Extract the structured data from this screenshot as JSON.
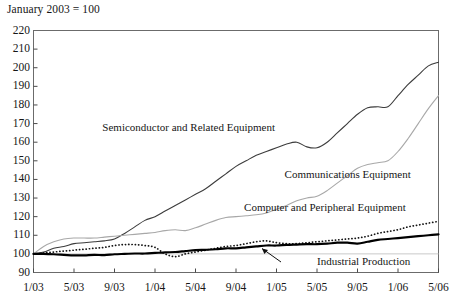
{
  "note": "January 2003 = 100",
  "chart_data": {
    "type": "line",
    "title": "",
    "subtitle": "January 2003 = 100",
    "xlabel": "",
    "ylabel": "",
    "grid": false,
    "legend_position": "inline-annotations",
    "xlim": [
      "1/03",
      "5/06"
    ],
    "ylim": [
      90,
      220
    ],
    "yticks": [
      90,
      100,
      110,
      120,
      130,
      140,
      150,
      160,
      170,
      180,
      190,
      200,
      210,
      220
    ],
    "xticks": [
      "1/03",
      "5/03",
      "9/03",
      "1/04",
      "5/04",
      "9/04",
      "1/05",
      "5/05",
      "9/05",
      "1/06",
      "5/06"
    ],
    "x": [
      "1/03",
      "2/03",
      "3/03",
      "4/03",
      "5/03",
      "6/03",
      "7/03",
      "8/03",
      "9/03",
      "10/03",
      "11/03",
      "12/03",
      "1/04",
      "2/04",
      "3/04",
      "4/04",
      "5/04",
      "6/04",
      "7/04",
      "8/04",
      "9/04",
      "10/04",
      "11/04",
      "12/04",
      "1/05",
      "2/05",
      "3/05",
      "4/05",
      "5/05",
      "6/05",
      "7/05",
      "8/05",
      "9/05",
      "10/05",
      "11/05",
      "12/05",
      "1/06",
      "2/06",
      "3/06",
      "4/06",
      "5/06"
    ],
    "series": [
      {
        "name": "Semiconductor and Related Equipment",
        "style": "solid-thin-dark",
        "color": "#3c3c3c",
        "label_x_pct": 17,
        "label_y_value": 168,
        "values": [
          100,
          101,
          103,
          104,
          105.5,
          106,
          106.5,
          107,
          108,
          111,
          114.5,
          118,
          120,
          123,
          126,
          129,
          132,
          135,
          139,
          143,
          147,
          150,
          153,
          155,
          157,
          159,
          160,
          157.5,
          157,
          160,
          165,
          170,
          175,
          178.5,
          179,
          179,
          185,
          191,
          196,
          201,
          203
        ]
      },
      {
        "name": "Communications Equipment",
        "style": "solid-thin-light",
        "color": "#a8a8a8",
        "label_x_pct": 62,
        "label_y_value": 143,
        "values": [
          100,
          104,
          106.5,
          108,
          108.5,
          108.5,
          108.5,
          109,
          109.5,
          110,
          110.5,
          111,
          111.5,
          112.5,
          113,
          112.5,
          114,
          116,
          118,
          119.5,
          120,
          120.5,
          121,
          122,
          124,
          126,
          128.5,
          130,
          131,
          134,
          138,
          142,
          146,
          148,
          149,
          150,
          155,
          162,
          170,
          178,
          185
        ]
      },
      {
        "name": "Computer and Peripheral Equipment",
        "style": "dotted",
        "color": "#141414",
        "label_x_pct": 52,
        "label_y_value": 125,
        "values": [
          100,
          100.5,
          101,
          101.5,
          102,
          102.5,
          103,
          103.5,
          104.5,
          105,
          105,
          104.5,
          103.5,
          100,
          98.5,
          100,
          101,
          102,
          103,
          104,
          104.5,
          105.5,
          106.5,
          107,
          106,
          105.5,
          105.5,
          106,
          106.5,
          107,
          107.5,
          108,
          108.5,
          109.5,
          111,
          112,
          113,
          114.5,
          115.5,
          116.5,
          117.5
        ]
      },
      {
        "name": "Industrial Production",
        "style": "solid-thick",
        "color": "#000000",
        "label_x_pct": 70,
        "label_y_value": 96,
        "values": [
          100,
          100,
          99.8,
          99.5,
          99.2,
          99.2,
          99.5,
          99.3,
          99.8,
          100,
          100.2,
          100.2,
          100.5,
          100.8,
          101,
          101.5,
          102,
          102.2,
          102.5,
          103,
          103,
          103.5,
          104,
          104.5,
          104.5,
          104.8,
          105,
          105.2,
          105.2,
          105.5,
          106,
          106,
          105.5,
          106.5,
          107.5,
          108,
          108.5,
          109,
          109.5,
          110,
          110.5
        ]
      }
    ]
  },
  "labels": {
    "semiconductor": "Semiconductor and Related Equipment",
    "communications": "Communications Equipment",
    "computer": "Computer and Peripheral Equipment",
    "industrial": "Industrial Production"
  }
}
